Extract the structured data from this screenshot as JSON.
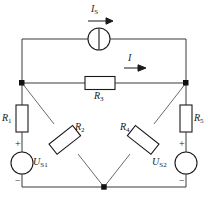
{
  "figure": {
    "type": "electrical-circuit-diagram",
    "background": "#ffffff",
    "wire_color": "#3a3a3a",
    "component_color": "#1a1a1a"
  },
  "components": {
    "current_source": {
      "name": "I_S",
      "symbol": "circle-with-vertical-bar",
      "label_main": "I",
      "label_sub": "S",
      "direction": "right"
    },
    "resistors": [
      {
        "id": "R1",
        "label_main": "R",
        "label_sub": "1",
        "orientation": "vertical",
        "position": "left-rail"
      },
      {
        "id": "R2",
        "label_main": "R",
        "label_sub": "2",
        "orientation": "diagonal-down-right",
        "position": "left-diagonal"
      },
      {
        "id": "R3",
        "label_main": "R",
        "label_sub": "3",
        "orientation": "horizontal",
        "position": "bridge-middle"
      },
      {
        "id": "R4",
        "label_main": "R",
        "label_sub": "4",
        "orientation": "diagonal-up-right",
        "position": "right-diagonal"
      },
      {
        "id": "R5",
        "label_main": "R",
        "label_sub": "5",
        "orientation": "vertical",
        "position": "right-rail"
      }
    ],
    "voltage_sources": [
      {
        "id": "US1",
        "label_main": "U",
        "label_sub": "S1",
        "symbol": "circle",
        "plus": "+",
        "minus": "−",
        "position": "left-rail"
      },
      {
        "id": "US2",
        "label_main": "U",
        "label_sub": "S2",
        "symbol": "circle",
        "plus": "+",
        "minus": "−",
        "position": "right-rail"
      }
    ],
    "currents": [
      {
        "id": "IS",
        "label_main": "I",
        "label_sub": "S",
        "arrow": "right",
        "branch": "top"
      },
      {
        "id": "I",
        "label_main": "I",
        "label_sub": "",
        "arrow": "right",
        "branch": "R3"
      }
    ],
    "nodes": [
      {
        "id": "node-left",
        "shape": "square"
      },
      {
        "id": "node-right",
        "shape": "square"
      },
      {
        "id": "node-bottom",
        "shape": "square"
      }
    ]
  }
}
